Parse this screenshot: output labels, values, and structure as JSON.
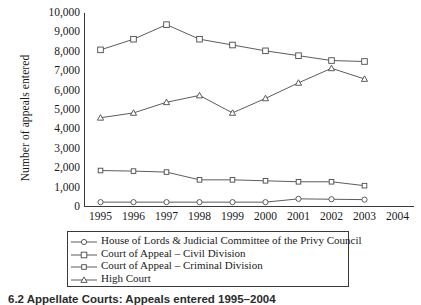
{
  "chart_data": {
    "type": "line",
    "title": "",
    "xlabel": "",
    "ylabel": "Number of appeals entered",
    "categories": [
      1995,
      1996,
      1997,
      1998,
      1999,
      2000,
      2001,
      2002,
      2003
    ],
    "xlim": [
      1994.5,
      2004.5
    ],
    "xticks": [
      1995,
      1996,
      1997,
      1998,
      1999,
      2000,
      2001,
      2002,
      2003,
      2004
    ],
    "ylim": [
      0,
      10000
    ],
    "yticks": [
      0,
      1000,
      2000,
      3000,
      4000,
      5000,
      6000,
      7000,
      8000,
      9000,
      10000
    ],
    "ytick_labels": [
      "0",
      "1,000",
      "2,000",
      "3,000",
      "4,000",
      "5,000",
      "6,000",
      "7,000",
      "8,000",
      "9,000",
      "10,000"
    ],
    "grid": false,
    "legend_position": "below",
    "series": [
      {
        "name": "House of Lords & Judicial Committee of the Privy Council",
        "marker": "circle",
        "values": [
          250,
          250,
          250,
          250,
          250,
          250,
          420,
          400,
          380
        ]
      },
      {
        "name": "Court of Appeal – Civil Division",
        "marker": "square",
        "values": [
          8100,
          8650,
          9400,
          8650,
          8350,
          8050,
          7800,
          7550,
          7500
        ]
      },
      {
        "name": "Court of Appeal – Criminal Division",
        "marker": "small-square",
        "values": [
          1880,
          1850,
          1800,
          1400,
          1400,
          1350,
          1300,
          1300,
          1100
        ]
      },
      {
        "name": "High Court",
        "marker": "triangle",
        "values": [
          4600,
          4850,
          5400,
          5750,
          4850,
          5600,
          6400,
          7150,
          6600
        ]
      }
    ]
  },
  "axis": {
    "ylabel": "Number of appeals entered"
  },
  "legend": {
    "entries": [
      {
        "label": "House of Lords & Judicial Committee of the Privy Council",
        "marker": "circle"
      },
      {
        "label": "Court of Appeal – Civil Division",
        "marker": "square"
      },
      {
        "label": "Court of Appeal – Criminal Division",
        "marker": "small-square"
      },
      {
        "label": "High Court",
        "marker": "triangle"
      }
    ]
  },
  "caption": {
    "text": "6.2 Appellate Courts: Appeals entered 1995–2004"
  },
  "colors": {
    "line": "#4a4a4a",
    "axis": "#3a3a3a",
    "marker_fill": "#ffffff",
    "text": "#1a1a1a"
  }
}
